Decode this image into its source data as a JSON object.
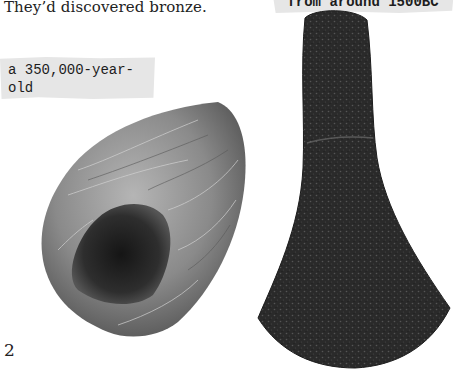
{
  "page": {
    "intro_text": "They’d discovered bronze.",
    "page_number": "2"
  },
  "captions": {
    "stone_axe": {
      "line1": "a 350,000-year-old",
      "line2": "stone axe from Spain"
    },
    "bronze_axe": {
      "text": "from around 1500BC"
    }
  },
  "images": {
    "stone_axe": {
      "label": "stone-hand-axe",
      "color": "#6e6e6e"
    },
    "bronze_axe": {
      "label": "bronze-axe-head",
      "color": "#2b2b2b"
    }
  }
}
